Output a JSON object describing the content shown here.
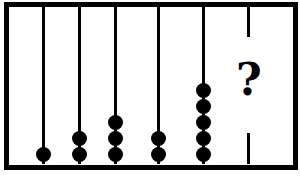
{
  "figure": {
    "type": "abacus",
    "rods": [
      {
        "position": 1,
        "beads": 1
      },
      {
        "position": 2,
        "beads": 2
      },
      {
        "position": 3,
        "beads": 3
      },
      {
        "position": 4,
        "beads": 2
      },
      {
        "position": 5,
        "beads": 5
      },
      {
        "position": 6,
        "beads": null,
        "label": "?"
      }
    ],
    "unknown_label": "?",
    "colors": {
      "frame": "#000000",
      "beads": "#000000",
      "background": "#ffffff"
    }
  }
}
